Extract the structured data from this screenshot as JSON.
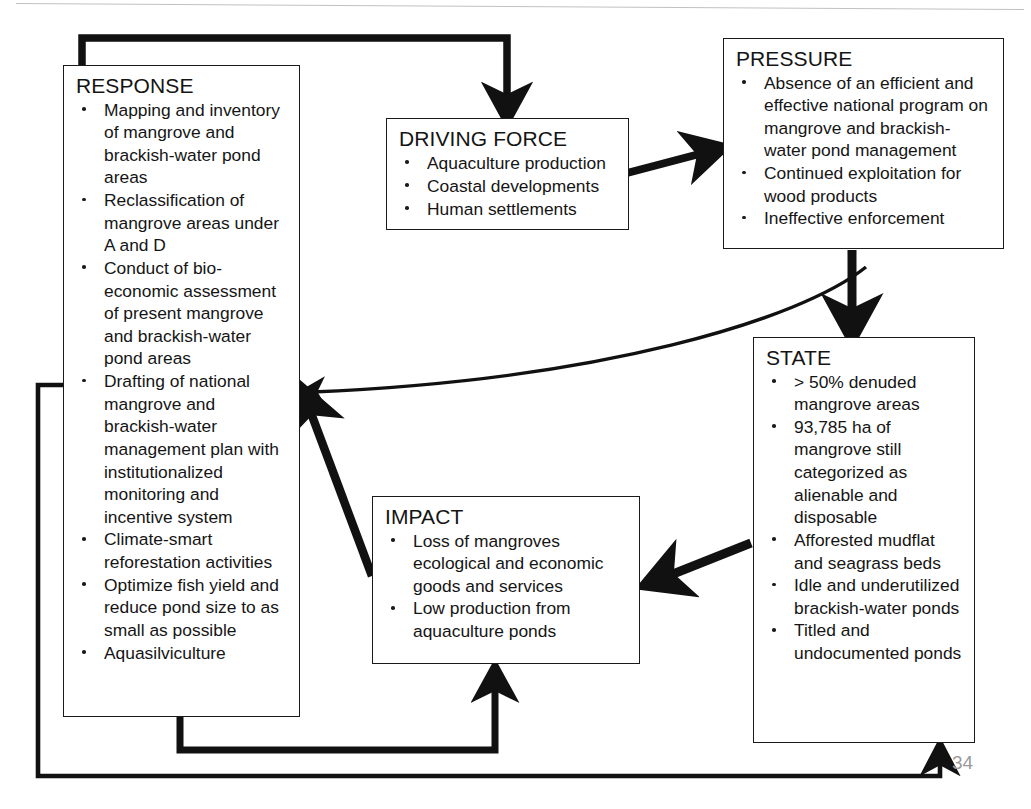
{
  "diagram": {
    "page_number": "34",
    "nodes": {
      "response": {
        "title": "RESPONSE",
        "bullets": [
          "Mapping and inventory of mangrove and brackish-water pond areas",
          "Reclassification of mangrove areas under A and D",
          "Conduct of bio-economic assessment of present mangrove and brackish-water pond areas",
          "Drafting of national mangrove and brackish-water management plan with institutionalized monitoring and incentive system",
          "Climate-smart reforestation activities",
          "Optimize fish yield and reduce pond size to as small as possible",
          "Aquasilviculture"
        ]
      },
      "driving_force": {
        "title": "DRIVING FORCE",
        "bullets": [
          "Aquaculture production",
          "Coastal developments",
          "Human settlements"
        ]
      },
      "pressure": {
        "title": "PRESSURE",
        "bullets": [
          "Absence of an efficient and effective national program on mangrove and brackish-water pond management",
          "Continued exploitation for wood products",
          "Ineffective enforcement"
        ]
      },
      "state": {
        "title": "STATE",
        "bullets": [
          "> 50% denuded mangrove areas",
          "93,785 ha of mangrove still categorized as alienable and disposable",
          "Afforested mudflat and seagrass beds",
          "Idle and underutilized brackish-water ponds",
          "Titled and undocumented ponds"
        ]
      },
      "impact": {
        "title": "IMPACT",
        "bullets": [
          "Loss of mangroves ecological and economic goods and services",
          "Low production from aquaculture ponds"
        ]
      }
    },
    "connections": [
      {
        "name": "response-to-driving-force",
        "from": "RESPONSE",
        "to": "DRIVING FORCE",
        "style": "thick elbow over the top"
      },
      {
        "name": "driving-force-to-pressure",
        "from": "DRIVING FORCE",
        "to": "PRESSURE",
        "style": "thick straight arrow up-right"
      },
      {
        "name": "pressure-to-state",
        "from": "PRESSURE",
        "to": "STATE",
        "style": "thick straight arrow down"
      },
      {
        "name": "state-to-impact",
        "from": "STATE",
        "to": "IMPACT",
        "style": "thick straight arrow down-left"
      },
      {
        "name": "impact-to-response",
        "from": "IMPACT",
        "to": "RESPONSE",
        "style": "thick straight arrow up-left"
      },
      {
        "name": "pressure-to-response",
        "from": "PRESSURE",
        "to": "RESPONSE",
        "style": "thin curved arrow left"
      },
      {
        "name": "response-to-impact",
        "from": "RESPONSE",
        "to": "IMPACT",
        "style": "thick elbow under the bottom"
      },
      {
        "name": "response-to-state",
        "from": "RESPONSE",
        "to": "STATE",
        "style": "thin elbow around the outside bottom"
      }
    ],
    "colors": {
      "ink": "#141414",
      "box_border": "#1a1a1a",
      "arrow": "#111111",
      "page_number": "#9a9a9a",
      "background": "#ffffff"
    }
  }
}
